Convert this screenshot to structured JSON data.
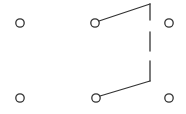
{
  "diagram": {
    "type": "switch-schematic",
    "stroke_color": "#333333",
    "background": "#ffffff",
    "terminals": [
      {
        "id": "t-left-top",
        "x": 20,
        "y": 23
      },
      {
        "id": "t-mid-top",
        "x": 95,
        "y": 23
      },
      {
        "id": "t-right-top",
        "x": 169,
        "y": 23
      },
      {
        "id": "t-left-bottom",
        "x": 20,
        "y": 98
      },
      {
        "id": "t-mid-bottom",
        "x": 96,
        "y": 98
      },
      {
        "id": "t-right-bottom",
        "x": 169,
        "y": 98
      }
    ],
    "blades": [
      {
        "id": "blade-top",
        "from": [
          100,
          21
        ],
        "to": [
          150,
          4
        ]
      },
      {
        "id": "blade-bottom",
        "from": [
          101,
          96
        ],
        "to": [
          150,
          81
        ]
      }
    ],
    "linkage": [
      {
        "from": [
          150,
          4
        ],
        "to": [
          150,
          20
        ]
      },
      {
        "from": [
          150,
          32
        ],
        "to": [
          150,
          51
        ]
      },
      {
        "from": [
          150,
          61
        ],
        "to": [
          150,
          81
        ]
      }
    ]
  }
}
